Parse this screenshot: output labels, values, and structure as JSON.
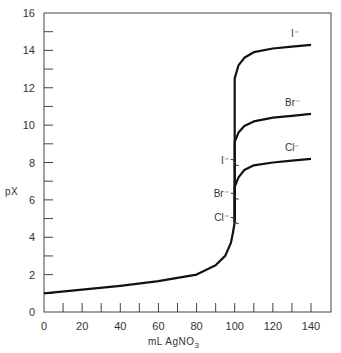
{
  "chart_data": {
    "type": "line",
    "title": "",
    "xlabel": "mL AgNO",
    "xlabel_subscript": "3",
    "ylabel": "pX",
    "xlim": [
      0,
      150
    ],
    "ylim": [
      0,
      16
    ],
    "x_ticks": [
      0,
      20,
      40,
      60,
      80,
      100,
      120,
      140
    ],
    "x_minor_ticks": [
      10,
      20,
      30,
      40,
      50,
      60,
      70,
      80,
      90,
      100,
      110,
      120,
      130,
      140
    ],
    "y_ticks": [
      0,
      2,
      4,
      6,
      8,
      10,
      12,
      14,
      16
    ],
    "y_minor_ticks": [
      1,
      3,
      5,
      7,
      9,
      11,
      13,
      15
    ],
    "grid": false,
    "legend": "inline labels at curve ends",
    "shared_pre_equivalence": {
      "x": [
        0,
        20,
        40,
        60,
        80,
        90,
        95,
        98,
        99,
        100
      ],
      "y": [
        1.0,
        1.2,
        1.4,
        1.65,
        2.0,
        2.5,
        3.0,
        3.7,
        4.2,
        4.8
      ]
    },
    "series": [
      {
        "name": "I-",
        "label": "I⁻",
        "x": [
          100,
          100,
          102,
          105,
          110,
          120,
          130,
          140
        ],
        "y": [
          4.8,
          12.5,
          13.2,
          13.6,
          13.9,
          14.1,
          14.2,
          14.3
        ]
      },
      {
        "name": "Br-",
        "label": "Br⁻",
        "x": [
          100,
          100,
          102,
          105,
          110,
          120,
          130,
          140
        ],
        "y": [
          4.8,
          9.1,
          9.6,
          9.95,
          10.2,
          10.4,
          10.5,
          10.6
        ]
      },
      {
        "name": "Cl-",
        "label": "Cl⁻",
        "x": [
          100,
          100,
          102,
          105,
          110,
          120,
          130,
          140
        ],
        "y": [
          4.8,
          6.7,
          7.2,
          7.6,
          7.85,
          8.0,
          8.1,
          8.2
        ]
      }
    ],
    "break_markers": [
      {
        "label": "I⁻",
        "x": 100,
        "y": 8.0
      },
      {
        "label": "Br⁻",
        "x": 100,
        "y": 6.2
      },
      {
        "label": "Cl⁻",
        "x": 100,
        "y": 4.9
      }
    ],
    "annotations": [
      "I⁻",
      "Br⁻",
      "Cl⁻"
    ]
  },
  "labels": {
    "ylabel": "pX",
    "xlabel": "mL AgNO",
    "xlabel_sub": "3"
  }
}
